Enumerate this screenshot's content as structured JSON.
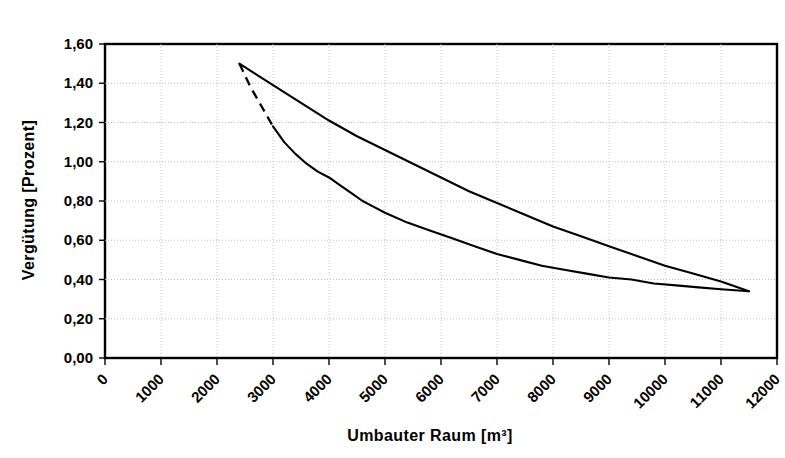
{
  "chart_data": {
    "type": "line",
    "title": "",
    "xlabel": "Umbauter Raum [m³]",
    "ylabel": "Vergütung [Prozent]",
    "xlim": [
      0,
      12000
    ],
    "ylim": [
      0.0,
      1.6
    ],
    "grid": true,
    "legend_position": "none",
    "x_tick_labels": [
      "0",
      "1000",
      "2000",
      "3000",
      "4000",
      "5000",
      "6000",
      "7000",
      "8000",
      "9000",
      "10000",
      "11000",
      "12000"
    ],
    "x_tick_values": [
      0,
      1000,
      2000,
      3000,
      4000,
      5000,
      6000,
      7000,
      8000,
      9000,
      10000,
      11000,
      12000
    ],
    "y_tick_labels": [
      "0,00",
      "0,20",
      "0,40",
      "0,60",
      "0,80",
      "1,00",
      "1,20",
      "1,40",
      "1,60"
    ],
    "y_tick_values": [
      0.0,
      0.2,
      0.4,
      0.6,
      0.8,
      1.0,
      1.2,
      1.4,
      1.6
    ],
    "series": [
      {
        "name": "upper-envelope",
        "style": "solid",
        "points": [
          [
            2400,
            1.5
          ],
          [
            3000,
            1.39
          ],
          [
            3500,
            1.3
          ],
          [
            4000,
            1.21
          ],
          [
            4500,
            1.13
          ],
          [
            5000,
            1.06
          ],
          [
            5500,
            0.99
          ],
          [
            6000,
            0.92
          ],
          [
            6500,
            0.85
          ],
          [
            7000,
            0.79
          ],
          [
            7500,
            0.73
          ],
          [
            8000,
            0.67
          ],
          [
            8500,
            0.62
          ],
          [
            9000,
            0.57
          ],
          [
            9500,
            0.52
          ],
          [
            10000,
            0.47
          ],
          [
            10500,
            0.43
          ],
          [
            11000,
            0.39
          ],
          [
            11500,
            0.34
          ]
        ]
      },
      {
        "name": "lower-envelope-dashed-head",
        "style": "dashed",
        "points": [
          [
            2400,
            1.5
          ],
          [
            2600,
            1.38
          ],
          [
            2800,
            1.28
          ],
          [
            3000,
            1.18
          ]
        ]
      },
      {
        "name": "lower-envelope",
        "style": "solid",
        "points": [
          [
            3000,
            1.18
          ],
          [
            3200,
            1.1
          ],
          [
            3400,
            1.04
          ],
          [
            3600,
            0.99
          ],
          [
            3800,
            0.95
          ],
          [
            4000,
            0.92
          ],
          [
            4200,
            0.88
          ],
          [
            4400,
            0.84
          ],
          [
            4600,
            0.8
          ],
          [
            4800,
            0.77
          ],
          [
            5000,
            0.74
          ],
          [
            5400,
            0.69
          ],
          [
            5800,
            0.65
          ],
          [
            6200,
            0.61
          ],
          [
            6600,
            0.57
          ],
          [
            7000,
            0.53
          ],
          [
            7400,
            0.5
          ],
          [
            7800,
            0.47
          ],
          [
            8200,
            0.45
          ],
          [
            8600,
            0.43
          ],
          [
            9000,
            0.41
          ],
          [
            9400,
            0.4
          ],
          [
            9800,
            0.38
          ],
          [
            10200,
            0.37
          ],
          [
            10600,
            0.36
          ],
          [
            11000,
            0.35
          ],
          [
            11500,
            0.34
          ]
        ]
      }
    ]
  }
}
